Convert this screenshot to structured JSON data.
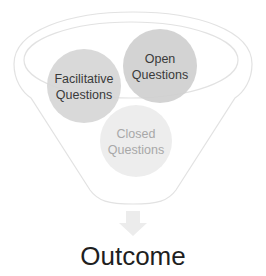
{
  "diagram": {
    "type": "funnel",
    "circles": [
      {
        "id": "facilitative",
        "lines": [
          "Facilitative",
          "Questions"
        ],
        "fill": "#d6d6d6",
        "text_color": "#3a3a3a"
      },
      {
        "id": "open",
        "lines": [
          "Open",
          "Questions"
        ],
        "fill": "#cfcfcf",
        "text_color": "#3a3a3a"
      },
      {
        "id": "closed",
        "lines": [
          "Closed",
          "Questions"
        ],
        "fill": "#ececec",
        "text_color": "#a8a8a8"
      }
    ],
    "funnel_stroke": "#e2e2e2",
    "arrow_color": "#ececec",
    "outcome": {
      "label": "Outcome",
      "color": "#1f1f1f"
    }
  }
}
